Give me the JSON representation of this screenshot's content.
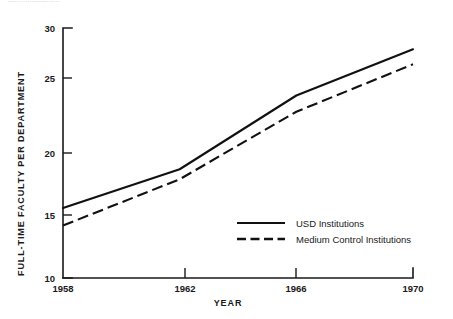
{
  "figure": {
    "clipped_top_caption": "........................",
    "ylabel": "FULL-TIME FACULTY PER DEPARTMENT",
    "xlabel": "YEAR"
  },
  "axes": {
    "y_ticks": [
      "10",
      "15",
      "20",
      "25",
      "30"
    ],
    "x_ticks": [
      "1958",
      "1962",
      "1966",
      "1970"
    ]
  },
  "legend": {
    "entries": [
      {
        "label": "USD Institutions",
        "style": "solid"
      },
      {
        "label": "Medium Control Institutions",
        "style": "dashed"
      }
    ]
  },
  "chart_data": {
    "type": "line",
    "title": "",
    "xlabel": "YEAR",
    "ylabel": "FULL-TIME FACULTY PER DEPARTMENT",
    "x": [
      1958,
      1962,
      1966,
      1970
    ],
    "xlim": [
      1958,
      1970
    ],
    "ylim": [
      10,
      30
    ],
    "ytick_values": [
      10,
      15,
      20,
      25,
      30
    ],
    "xtick_values": [
      1958,
      1962,
      1966,
      1970
    ],
    "grid": false,
    "legend_position": "center-right-inside",
    "series": [
      {
        "name": "USD Institutions",
        "style": "solid",
        "values": [
          15.6,
          18.7,
          24.6,
          28.3
        ]
      },
      {
        "name": "Medium Control Institutions",
        "style": "dashed",
        "values": [
          14.2,
          17.9,
          23.3,
          27.1
        ]
      }
    ]
  }
}
